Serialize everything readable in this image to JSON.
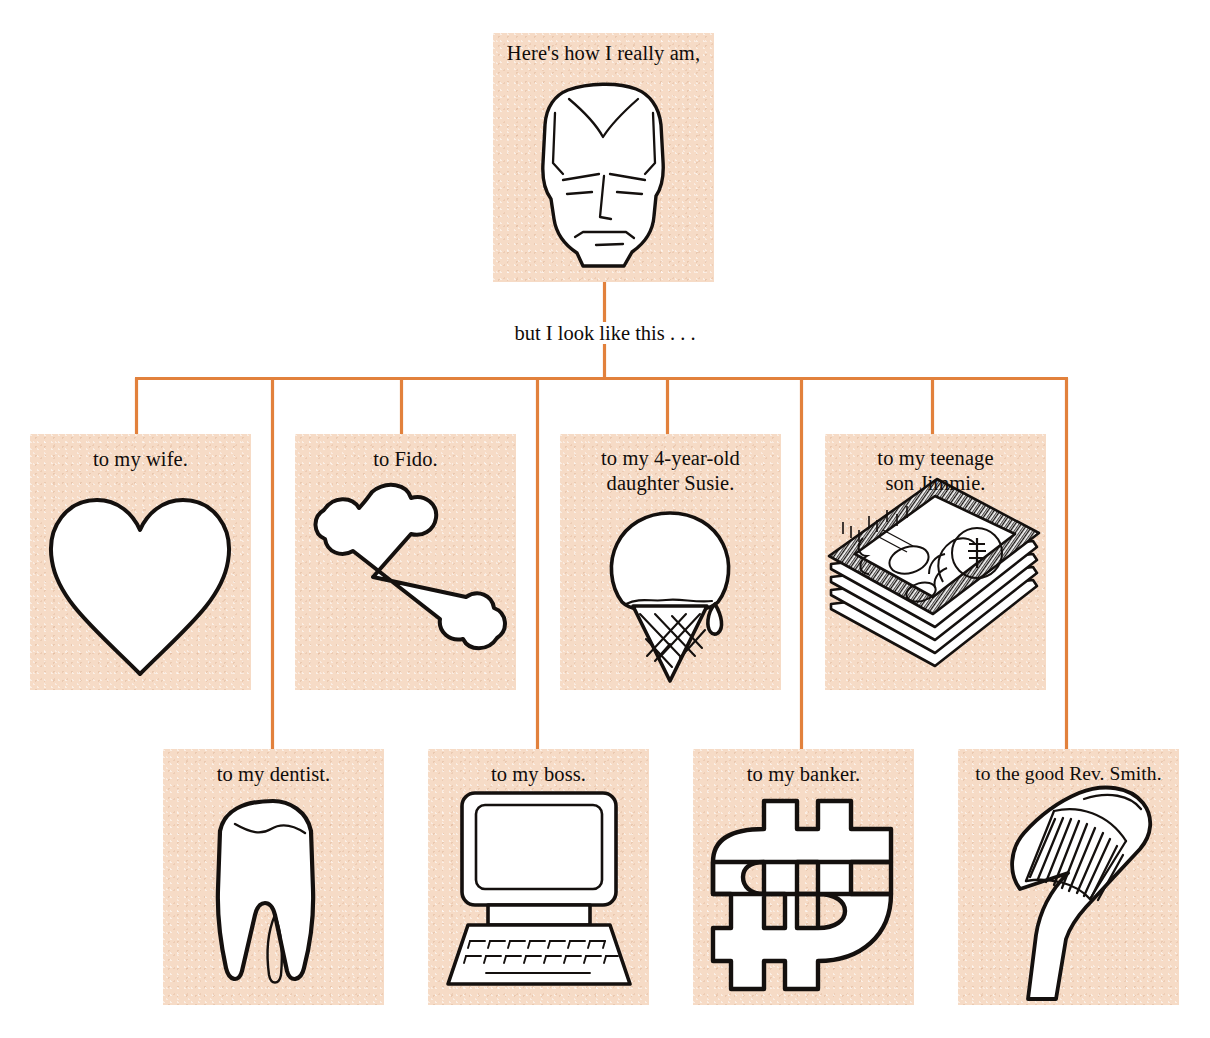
{
  "diagram": {
    "title_top": "Here's how I really am,",
    "connector_caption": "but I look like this . . .",
    "accent_color": "#e2813c",
    "panel_color": "#f6dbc6",
    "ink_color": "#100c0a"
  },
  "root": {
    "label": "Here's how I really am,",
    "icon": "mans-face-icon"
  },
  "branches": [
    {
      "id": "wife",
      "label": "to my wife.",
      "icon": "heart-icon",
      "row": 1
    },
    {
      "id": "fido",
      "label": "to Fido.",
      "icon": "dog-bone-icon",
      "row": 1
    },
    {
      "id": "susie",
      "label": "to my 4-year-old\ndaughter Susie.",
      "icon": "ice-cream-cone-icon",
      "row": 1
    },
    {
      "id": "jimmie",
      "label": "to my teenage\nson Jimmie.",
      "icon": "money-stack-icon",
      "row": 1
    },
    {
      "id": "dentist",
      "label": "to my dentist.",
      "icon": "tooth-icon",
      "row": 2
    },
    {
      "id": "boss",
      "label": "to my boss.",
      "icon": "computer-icon",
      "row": 2
    },
    {
      "id": "banker",
      "label": "to my banker.",
      "icon": "dollar-sign-icon",
      "row": 2
    },
    {
      "id": "rev",
      "label": "to the good Rev. Smith.",
      "icon": "golf-club-icon",
      "row": 2
    }
  ],
  "captions": {
    "wife_line1": "to my wife.",
    "fido_line1": "to Fido.",
    "susie_line1": "to my 4-year-old",
    "susie_line2": "daughter Susie.",
    "jimmie_line1": "to my teenage",
    "jimmie_line2": "son Jimmie.",
    "dentist_line1": "to my dentist.",
    "boss_line1": "to my boss.",
    "banker_line1": "to my banker.",
    "rev_line1": "to the good Rev. Smith."
  }
}
